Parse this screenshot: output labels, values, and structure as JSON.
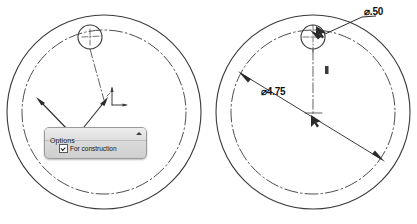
{
  "app": {
    "kind": "cad-sketch-viewport",
    "background_color": "#ffffff",
    "line_color": "#3a3a3a"
  },
  "views": [
    {
      "id": "left-view",
      "name": "construction-circle-view",
      "center": {
        "x": 104,
        "y": 112
      },
      "outer_radius": 97,
      "inner_radius": 82,
      "construction_circle_radius": 82,
      "hole": {
        "cx": 90,
        "cy": 37,
        "r": 12
      },
      "annotations": {
        "arrow_count": 2,
        "origin_marker": true
      }
    },
    {
      "id": "right-view",
      "name": "dimensioned-circle-view",
      "center": {
        "x": 313,
        "y": 112
      },
      "outer_radius": 97,
      "inner_radius": 82,
      "hole": {
        "cx": 313,
        "cy": 37,
        "r": 12
      },
      "annotations": {
        "origin_marker": true,
        "midpoint_tick": true
      }
    }
  ],
  "dimensions": [
    {
      "name": "hole-diameter",
      "label": "⌀.50",
      "value": 0.5,
      "symbol": "⌀",
      "leader": "from hole at top to upper-right text"
    },
    {
      "name": "bolt-circle-diameter",
      "label": "⌀4.75",
      "value": 4.75,
      "symbol": "⌀",
      "leader": "diagonal diameter line across construction circle"
    }
  ],
  "options_panel": {
    "title": "Options",
    "collapse_icon": "triangle-up-icon",
    "checkbox": {
      "label": "For construction",
      "checked": true
    }
  }
}
